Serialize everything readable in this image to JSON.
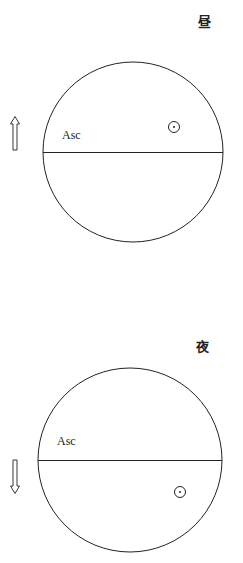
{
  "panels": [
    {
      "title": "昼",
      "asc_label": "Asc",
      "arrow_direction": "up",
      "sun_position": "above-horizon",
      "sun_symbol": "☉"
    },
    {
      "title": "夜",
      "asc_label": "Asc",
      "arrow_direction": "down",
      "sun_position": "below-horizon",
      "sun_symbol": "☉"
    }
  ],
  "colors": {
    "stroke": "#222222",
    "background": "#ffffff"
  }
}
